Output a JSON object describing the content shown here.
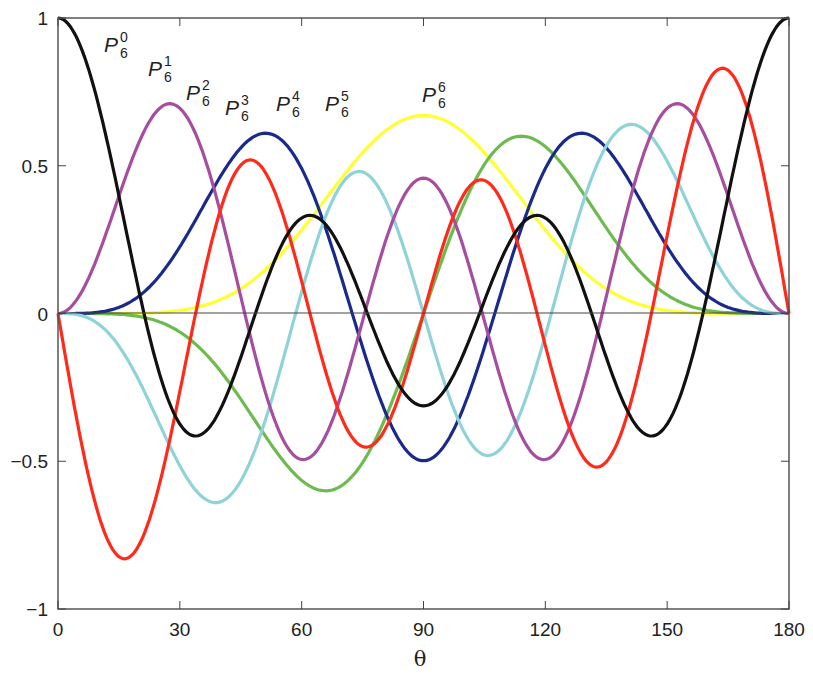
{
  "chart_data": {
    "type": "line",
    "title": "",
    "xlabel": "θ",
    "ylabel": "",
    "xlim": [
      0,
      180
    ],
    "ylim": [
      -1,
      1
    ],
    "x_ticks": [
      "0",
      "30",
      "60",
      "90",
      "120",
      "150",
      "180"
    ],
    "y_ticks": [
      "−1",
      "−0.5",
      "0",
      "0.5",
      "1"
    ],
    "grid": false,
    "legend": "inline labels",
    "x": [
      0,
      15,
      30,
      45,
      60,
      75,
      90,
      105,
      120,
      135,
      150,
      165,
      180
    ],
    "series": [
      {
        "name": "P_6^0",
        "color": "#111111",
        "peak_label_pos": [
          20,
          0.93
        ],
        "max_abs": 1.0,
        "values": [
          1.0,
          0.46,
          -0.38,
          -0.41,
          0.32,
          0.12,
          -0.31,
          0.12,
          0.32,
          -0.41,
          -0.38,
          0.46,
          1.0
        ]
      },
      {
        "name": "P_6^1",
        "color": "#ff2a1a",
        "peak_label_pos": [
          27,
          0.86
        ],
        "max_abs": 0.83,
        "values": [
          0.0,
          0.83,
          0.29,
          -0.51,
          -0.09,
          0.44,
          0.0,
          -0.44,
          0.09,
          0.51,
          -0.29,
          -0.83,
          0.0
        ]
      },
      {
        "name": "P_6^2",
        "color": "#a54d9e",
        "peak_label_pos": [
          36,
          0.77
        ],
        "max_abs": 0.71,
        "values": [
          0.0,
          0.34,
          0.69,
          0.03,
          -0.48,
          0.09,
          0.45,
          0.09,
          -0.48,
          0.03,
          0.69,
          0.34,
          0.0
        ]
      },
      {
        "name": "P_6^3",
        "color": "#8fd3d8",
        "peak_label_pos": [
          48,
          0.66
        ],
        "max_abs": 0.64,
        "values": [
          0.0,
          0.1,
          0.5,
          0.57,
          -0.15,
          -0.46,
          0.0,
          0.46,
          0.15,
          -0.57,
          -0.5,
          -0.1,
          0.0
        ]
      },
      {
        "name": "P_6^4",
        "color": "#1a2a8a",
        "peak_label_pos": [
          61,
          0.63
        ],
        "max_abs": 0.61,
        "values": [
          0.0,
          0.02,
          0.21,
          0.56,
          0.43,
          -0.17,
          -0.49,
          -0.17,
          0.43,
          0.56,
          0.21,
          0.02,
          0.0
        ]
      },
      {
        "name": "P_6^5",
        "color": "#6dbb4f",
        "peak_label_pos": [
          74,
          0.63
        ],
        "max_abs": 0.6,
        "values": [
          0.0,
          0.0,
          0.07,
          0.34,
          0.59,
          0.42,
          0.0,
          -0.42,
          -0.59,
          -0.34,
          -0.07,
          0.0,
          0.0
        ]
      },
      {
        "name": "P_6^6",
        "color": "#ffff33",
        "peak_label_pos": [
          90,
          0.71
        ],
        "max_abs": 0.67,
        "values": [
          0.0,
          0.0,
          0.01,
          0.08,
          0.28,
          0.54,
          0.67,
          0.54,
          0.28,
          0.08,
          0.01,
          0.0,
          0.0
        ]
      }
    ]
  },
  "labels": [
    {
      "base": "P",
      "sub": "6",
      "sup": "0"
    },
    {
      "base": "P",
      "sub": "6",
      "sup": "1"
    },
    {
      "base": "P",
      "sub": "6",
      "sup": "2"
    },
    {
      "base": "P",
      "sub": "6",
      "sup": "3"
    },
    {
      "base": "P",
      "sub": "6",
      "sup": "4"
    },
    {
      "base": "P",
      "sub": "6",
      "sup": "5"
    },
    {
      "base": "P",
      "sub": "6",
      "sup": "6"
    }
  ]
}
